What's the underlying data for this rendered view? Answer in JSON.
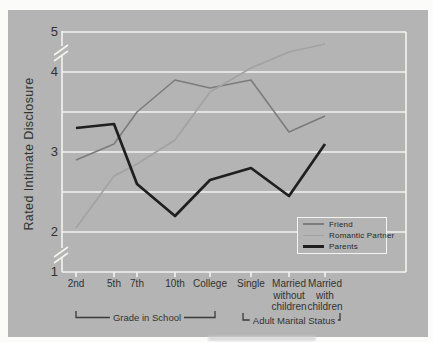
{
  "page": {
    "background": "#fbfbfa"
  },
  "panel": {
    "background": "#b4b4b4"
  },
  "chart_data": {
    "type": "line",
    "ylabel": "Rated Intimate Disclosure",
    "x_categories": [
      "2nd",
      "5th",
      "7th",
      "10th",
      "College",
      "Single",
      "Married\nwithout\nchildren",
      "Married\nwith\nchildren"
    ],
    "x_groups": [
      {
        "label": "Grade in School",
        "from": "2nd",
        "to": "College"
      },
      {
        "label": "Adult Marital Status",
        "from": "Single",
        "to": "Married with children"
      }
    ],
    "y_ticks": [
      5,
      4,
      3,
      2,
      1
    ],
    "y_gridline_values": [
      5,
      4,
      3.5,
      3,
      2.5,
      2,
      1
    ],
    "y_axis_breaks": [
      "between 4 and 5",
      "between 1 and 2"
    ],
    "grid": true,
    "legend": {
      "position": "lower-right",
      "entries": [
        "Friend",
        "Romantic Partner",
        "Parents"
      ]
    },
    "series": [
      {
        "name": "Friend",
        "color": "#7c7c7c",
        "line_width": 1.6,
        "values": [
          2.9,
          3.1,
          3.5,
          3.9,
          3.8,
          3.9,
          3.25,
          3.45
        ]
      },
      {
        "name": "Romantic Partner",
        "color": "#a2a2a2",
        "line_width": 1.6,
        "values": [
          2.05,
          2.7,
          2.85,
          3.15,
          3.75,
          4.05,
          4.25,
          4.35
        ]
      },
      {
        "name": "Parents",
        "color": "#1f1f1f",
        "line_width": 2.7,
        "values": [
          3.3,
          3.35,
          2.6,
          2.2,
          2.65,
          2.8,
          2.45,
          3.1
        ]
      }
    ],
    "axis_color": "#f3f3f1",
    "bracket_color": "#3a3a3a",
    "text_color": "#323232"
  }
}
